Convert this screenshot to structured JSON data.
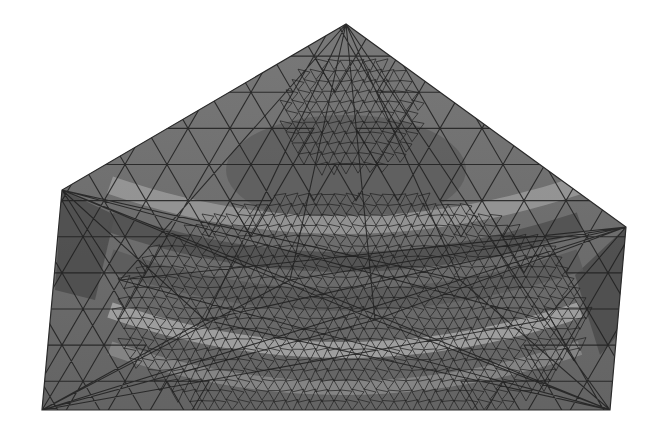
{
  "figure": {
    "type": "finite-element-mesh",
    "description": "Grayscale triangulated surface mesh of a pentagon-shaped domain with curved wave-like shading bands",
    "colors": {
      "background": "#ffffff",
      "base_fill": "#6e6e6e",
      "dark_fill": "#4a4a4a",
      "light_band": "#b4b4b4",
      "edge": "#1e1e1e"
    },
    "outline": [
      [
        346,
        24
      ],
      [
        62,
        190
      ],
      [
        42,
        410
      ],
      [
        610,
        410
      ],
      [
        626,
        227
      ]
    ],
    "corner_patches": {
      "left": [
        [
          62,
          190
        ],
        [
          115,
          215
        ],
        [
          95,
          300
        ],
        [
          55,
          290
        ]
      ],
      "right": [
        [
          626,
          227
        ],
        [
          575,
          275
        ],
        [
          600,
          355
        ],
        [
          622,
          330
        ]
      ]
    }
  }
}
